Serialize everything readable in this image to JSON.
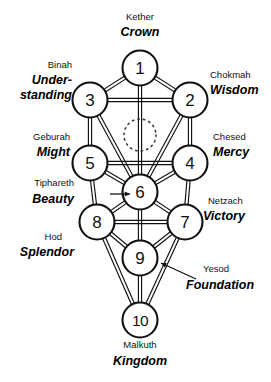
{
  "diagram": {
    "type": "kabbalah-sephiroth-diagram",
    "colors": {
      "background": "#ffffff",
      "stroke": "#111111",
      "text": "#111111"
    },
    "nodes": [
      {
        "number": "1",
        "hebrew": "Kether",
        "english": "Crown",
        "cx": 140,
        "cy": 68,
        "r": 17.5
      },
      {
        "number": "2",
        "hebrew": "Chokmah",
        "english": "Wisdom",
        "cx": 190,
        "cy": 100,
        "r": 17.5
      },
      {
        "number": "3",
        "hebrew": "Binah",
        "english": "Under-standing",
        "cx": 90,
        "cy": 100,
        "r": 17.5
      },
      {
        "number": "4",
        "hebrew": "Chesed",
        "english": "Mercy",
        "cx": 190,
        "cy": 163,
        "r": 17.5
      },
      {
        "number": "5",
        "hebrew": "Geburah",
        "english": "Might",
        "cx": 90,
        "cy": 163,
        "r": 17.5
      },
      {
        "number": "6",
        "hebrew": "Tiphareth",
        "english": "Beauty",
        "cx": 140,
        "cy": 192,
        "r": 17.5
      },
      {
        "number": "7",
        "hebrew": "Netzach",
        "english": "Victory",
        "cx": 185,
        "cy": 222,
        "r": 17.5
      },
      {
        "number": "8",
        "hebrew": "Hod",
        "english": "Splendor",
        "cx": 97,
        "cy": 222,
        "r": 17.5
      },
      {
        "number": "9",
        "hebrew": "Yesod",
        "english": "Foundation",
        "cx": 140,
        "cy": 258,
        "r": 17.5
      },
      {
        "number": "10",
        "hebrew": "Malkuth",
        "english": "Kingdom",
        "cx": 140,
        "cy": 320,
        "r": 17.5
      }
    ],
    "hidden_sphere": {
      "name": "Daath",
      "visible_label": "",
      "cx": 140,
      "cy": 135,
      "r": 16,
      "style": "dotted"
    },
    "labels": [
      {
        "id": "kether",
        "hebrew": "Kether",
        "english": "Crown",
        "align": "middle",
        "hx": 140,
        "hy": 20,
        "ex": 140,
        "ey": 36
      },
      {
        "id": "chokmah",
        "hebrew": "Chokmah",
        "english": "Wisdom",
        "align": "start",
        "hx": 210,
        "hy": 78,
        "ex": 210,
        "ey": 94
      },
      {
        "id": "binah",
        "hebrew": "Binah",
        "english": "Under-",
        "english2": "standing",
        "align": "end",
        "hx": 72,
        "hy": 68,
        "ex": 72,
        "ey": 84
      },
      {
        "id": "chesed",
        "hebrew": "Chesed",
        "english": "Mercy",
        "align": "start",
        "hx": 213,
        "hy": 140,
        "ex": 213,
        "ey": 156
      },
      {
        "id": "geburah",
        "hebrew": "Geburah",
        "english": "Might",
        "align": "end",
        "hx": 70,
        "hy": 140,
        "ex": 70,
        "ey": 156
      },
      {
        "id": "tiphareth",
        "hebrew": "Tiphareth",
        "english": "Beauty",
        "align": "end",
        "hx": 74,
        "hy": 186,
        "ex": 74,
        "ey": 203
      },
      {
        "id": "netzach",
        "hebrew": "Netzach",
        "english": "Victory",
        "align": "start",
        "hx": 208,
        "hy": 204,
        "ex": 203,
        "ey": 220
      },
      {
        "id": "hod",
        "hebrew": "Hod",
        "english": "Splendor",
        "align": "end",
        "hx": 62,
        "hy": 240,
        "ex": 74,
        "ey": 256
      },
      {
        "id": "yesod",
        "hebrew": "Yesod",
        "english": "Foundation",
        "align": "start",
        "hx": 203,
        "hy": 272,
        "ex": 186,
        "ey": 289
      },
      {
        "id": "malkuth",
        "hebrew": "Malkuth",
        "english": "Kingdom",
        "align": "middle",
        "hx": 140,
        "hy": 348,
        "ex": 140,
        "ey": 365
      }
    ],
    "paths": [
      [
        "1",
        "2"
      ],
      [
        "1",
        "3"
      ],
      [
        "1",
        "6"
      ],
      [
        "2",
        "3"
      ],
      [
        "2",
        "4"
      ],
      [
        "2",
        "6"
      ],
      [
        "3",
        "5"
      ],
      [
        "3",
        "6"
      ],
      [
        "4",
        "5"
      ],
      [
        "4",
        "6"
      ],
      [
        "4",
        "7"
      ],
      [
        "5",
        "6"
      ],
      [
        "5",
        "8"
      ],
      [
        "6",
        "7"
      ],
      [
        "6",
        "8"
      ],
      [
        "6",
        "9"
      ],
      [
        "7",
        "8"
      ],
      [
        "7",
        "9"
      ],
      [
        "7",
        "10"
      ],
      [
        "8",
        "9"
      ],
      [
        "8",
        "10"
      ],
      [
        "9",
        "10"
      ]
    ],
    "pointers": [
      {
        "from_label": "tiphareth",
        "to_node": "6",
        "x1": 110,
        "y1": 194,
        "x2": 130,
        "y2": 194
      },
      {
        "from_label": "yesod",
        "to_node": "9",
        "x1": 196,
        "y1": 279,
        "x2": 161,
        "y2": 263
      }
    ]
  }
}
